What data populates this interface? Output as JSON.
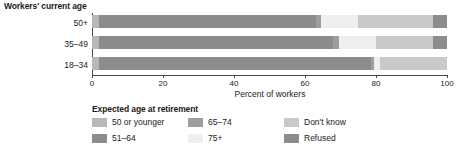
{
  "chart_data": {
    "type": "bar",
    "orientation": "horizontal",
    "stacked": true,
    "normalized": true,
    "title": "",
    "group_axis_title": "Workers' current age",
    "xlabel": "Percent of workers",
    "ylabel": "",
    "xlim": [
      0,
      100
    ],
    "xticks": [
      0,
      20,
      40,
      60,
      80,
      100
    ],
    "xticklabels": [
      "0",
      "20",
      "40",
      "60",
      "80",
      "100"
    ],
    "grid": false,
    "legend_title": "Expected age at retirement",
    "legend_position": "below",
    "categories": [
      "18–34",
      "35–49",
      "50+"
    ],
    "display_order_top_to_bottom": [
      "50+",
      "35–49",
      "18–34"
    ],
    "series": [
      {
        "name": "50 or younger",
        "color": "#b8b8b8",
        "values": [
          2,
          2,
          2
        ]
      },
      {
        "name": "51–64",
        "color": "#8c8c8c",
        "values": [
          77,
          67,
          62
        ]
      },
      {
        "name": "65–74",
        "color": "#9e9e9e",
        "values": [
          1,
          1,
          1
        ]
      },
      {
        "name": "75+",
        "color": "#efefef",
        "values": [
          1,
          10,
          10
        ]
      },
      {
        "name": "Don't know",
        "color": "#c9c9c9",
        "values": [
          19,
          16,
          21
        ]
      },
      {
        "name": "Refused",
        "color": "#8c8c8c",
        "values": [
          0,
          4,
          4
        ]
      }
    ],
    "bars": [
      {
        "category": "50+",
        "segments": [
          {
            "label": "50 or younger",
            "start": 0,
            "end": 2,
            "value": 2,
            "color": "#b8b8b8"
          },
          {
            "label": "51–64",
            "start": 2,
            "end": 63,
            "value": 61,
            "color": "#8c8c8c"
          },
          {
            "label": "65–74",
            "start": 63,
            "end": 64.5,
            "value": 1.5,
            "color": "#9e9e9e"
          },
          {
            "label": "75+",
            "start": 64.5,
            "end": 75,
            "value": 10.5,
            "color": "#efefef"
          },
          {
            "label": "Don't know",
            "start": 75,
            "end": 96,
            "value": 21,
            "color": "#c9c9c9"
          },
          {
            "label": "Refused",
            "start": 96,
            "end": 100,
            "value": 4,
            "color": "#8c8c8c"
          }
        ]
      },
      {
        "category": "35–49",
        "segments": [
          {
            "label": "50 or younger",
            "start": 0,
            "end": 2,
            "value": 2,
            "color": "#b8b8b8"
          },
          {
            "label": "51–64",
            "start": 2,
            "end": 68,
            "value": 66,
            "color": "#8c8c8c"
          },
          {
            "label": "65–74",
            "start": 68,
            "end": 69.5,
            "value": 1.5,
            "color": "#9e9e9e"
          },
          {
            "label": "75+",
            "start": 69.5,
            "end": 80,
            "value": 10.5,
            "color": "#efefef"
          },
          {
            "label": "Don't know",
            "start": 80,
            "end": 96,
            "value": 16,
            "color": "#c9c9c9"
          },
          {
            "label": "Refused",
            "start": 96,
            "end": 100,
            "value": 4,
            "color": "#8c8c8c"
          }
        ]
      },
      {
        "category": "18–34",
        "segments": [
          {
            "label": "50 or younger",
            "start": 0,
            "end": 2,
            "value": 2,
            "color": "#b8b8b8"
          },
          {
            "label": "51–64",
            "start": 2,
            "end": 78.5,
            "value": 76.5,
            "color": "#8c8c8c"
          },
          {
            "label": "65–74",
            "start": 78.5,
            "end": 79.5,
            "value": 1,
            "color": "#9e9e9e"
          },
          {
            "label": "75+",
            "start": 79.5,
            "end": 81,
            "value": 1.5,
            "color": "#efefef"
          },
          {
            "label": "Don't know",
            "start": 81,
            "end": 100,
            "value": 19,
            "color": "#c9c9c9"
          }
        ]
      }
    ]
  },
  "legend": {
    "title": "Expected age at retirement",
    "items": [
      {
        "label": "50 or younger",
        "color": "#b8b8b8",
        "col": 0,
        "row": 0
      },
      {
        "label": "51–64",
        "color": "#8c8c8c",
        "col": 0,
        "row": 1
      },
      {
        "label": "65–74",
        "color": "#9e9e9e",
        "col": 1,
        "row": 0
      },
      {
        "label": "75+",
        "color": "#efefef",
        "col": 1,
        "row": 1
      },
      {
        "label": "Don't know",
        "color": "#c9c9c9",
        "col": 2,
        "row": 0
      },
      {
        "label": "Refused",
        "color": "#8c8c8c",
        "col": 2,
        "row": 1
      }
    ]
  },
  "axis": {
    "group_title": "Workers' current age",
    "x_title": "Percent of workers",
    "ticks": [
      "0",
      "20",
      "40",
      "60",
      "80",
      "100"
    ],
    "categories_top_to_bottom": [
      "50+",
      "35–49",
      "18–34"
    ]
  },
  "colors": {
    "axis": "#4a4a4a",
    "text": "#1a1a1a",
    "background": "#ffffff"
  }
}
